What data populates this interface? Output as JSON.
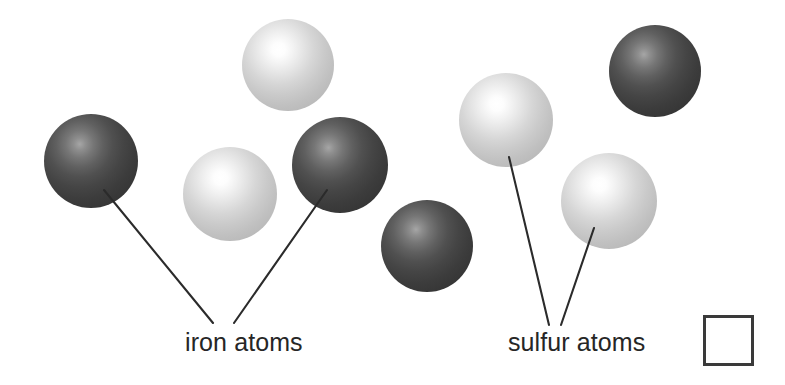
{
  "figure": {
    "background_color": "#ffffff",
    "width": 785,
    "height": 385
  },
  "atoms": [
    {
      "id": "iron-1",
      "element": "iron",
      "kind": "dark",
      "cx": 91,
      "cy": 161,
      "r": 47,
      "label_group": "iron"
    },
    {
      "id": "sulfur-1",
      "element": "sulfur",
      "kind": "light",
      "cx": 288,
      "cy": 65,
      "r": 46,
      "label_group": "none"
    },
    {
      "id": "sulfur-2",
      "element": "sulfur",
      "kind": "light",
      "cx": 230,
      "cy": 194,
      "r": 47,
      "label_group": "none"
    },
    {
      "id": "iron-2",
      "element": "iron",
      "kind": "dark",
      "cx": 340,
      "cy": 165,
      "r": 48,
      "label_group": "iron"
    },
    {
      "id": "iron-3",
      "element": "iron",
      "kind": "dark",
      "cx": 427,
      "cy": 246,
      "r": 46,
      "label_group": "none"
    },
    {
      "id": "sulfur-3",
      "element": "sulfur",
      "kind": "light",
      "cx": 506,
      "cy": 120,
      "r": 47,
      "label_group": "sulfur"
    },
    {
      "id": "sulfur-4",
      "element": "sulfur",
      "kind": "light",
      "cx": 609,
      "cy": 201,
      "r": 48,
      "label_group": "sulfur"
    },
    {
      "id": "iron-4",
      "element": "iron",
      "kind": "dark",
      "cx": 655,
      "cy": 71,
      "r": 46,
      "label_group": "none"
    }
  ],
  "leader_lines": [
    {
      "id": "iron-leader-left",
      "x1": 104,
      "y1": 190,
      "x2": 213,
      "y2": 323
    },
    {
      "id": "iron-leader-right",
      "x1": 327,
      "y1": 190,
      "x2": 234,
      "y2": 323
    },
    {
      "id": "sulfur-leader-left",
      "x1": 509,
      "y1": 157,
      "x2": 549,
      "y2": 325
    },
    {
      "id": "sulfur-leader-right",
      "x1": 594,
      "y1": 228,
      "x2": 561,
      "y2": 325
    }
  ],
  "labels": {
    "iron": {
      "text": "iron atoms",
      "x": 185,
      "y": 330
    },
    "sulfur": {
      "text": "sulfur atoms",
      "x": 508,
      "y": 330
    }
  },
  "answer_box": {
    "name": "answer-checkbox",
    "x": 703,
    "y": 315,
    "width": 51,
    "height": 51,
    "value": "",
    "border_color": "#3a3a3a",
    "fill_color": "#ffffff"
  },
  "colors": {
    "iron_atom_dark": "#3c3c3c",
    "iron_atom_highlight": "#a6a6a6",
    "sulfur_atom_base": "#c8c8c8",
    "sulfur_atom_highlight": "#ffffff",
    "leader_line": "#2b2b2b",
    "text": "#262626"
  }
}
